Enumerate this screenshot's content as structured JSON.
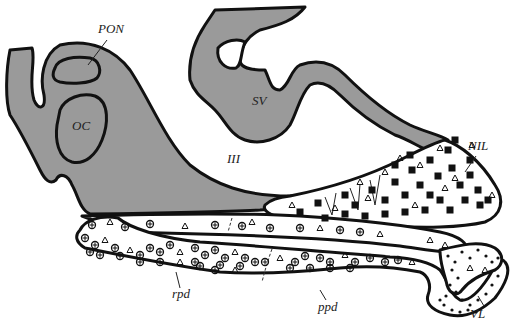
{
  "figure": {
    "type": "anatomical-diagram",
    "labels": {
      "pon": "PON",
      "oc": "OC",
      "sv": "SV",
      "iii": "III",
      "nil": "NIL",
      "rpd": "rpd",
      "ppd": "ppd",
      "vl": "VL"
    },
    "legend_symbols": {
      "filled_square": "neurosecretory terminal",
      "open_triangle": "cell type triangle",
      "circled_plus": "cell type circled cross",
      "dot": "cell type dot"
    },
    "colors": {
      "neural_tissue": "#9a9a9a",
      "outline": "#111111",
      "background": "#ffffff"
    }
  }
}
